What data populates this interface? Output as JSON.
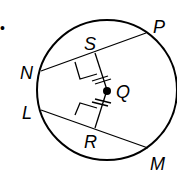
{
  "diagram": {
    "bullet": "•",
    "circle": {
      "cx": 107,
      "cy": 90,
      "r": 70
    },
    "center_label": "Q",
    "points": {
      "N": {
        "label": "N",
        "x": 41,
        "y": 71
      },
      "P": {
        "label": "P",
        "x": 146,
        "y": 33
      },
      "L": {
        "label": "L",
        "x": 41,
        "y": 110
      },
      "M": {
        "label": "M",
        "x": 148,
        "y": 148
      },
      "S": {
        "label": "S",
        "x": 95,
        "y": 53
      },
      "R": {
        "label": "R",
        "x": 95,
        "y": 128
      }
    },
    "chords": [
      "NP",
      "LM"
    ],
    "perpendiculars": [
      "QS ⊥ NP",
      "QR ⊥ LM"
    ],
    "congruent_marks": "QS ≅ QR"
  }
}
